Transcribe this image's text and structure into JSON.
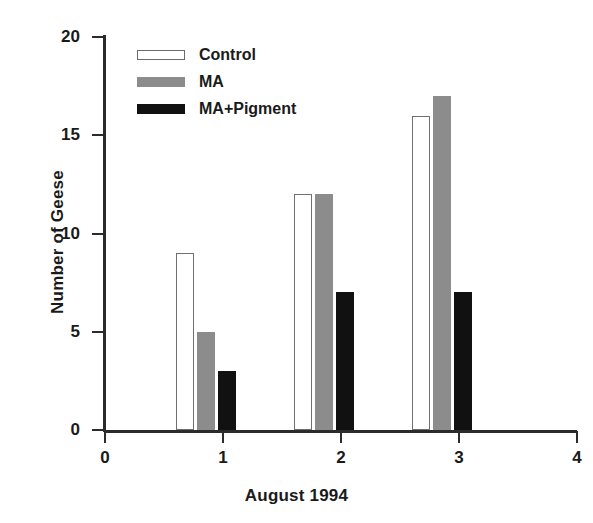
{
  "chart_data": {
    "type": "bar",
    "title": "",
    "xlabel": "August 1994",
    "ylabel": "Number of Geese",
    "categories": [
      "1",
      "2",
      "3"
    ],
    "series": [
      {
        "name": "Control",
        "values": [
          9,
          5,
          3
        ],
        "color": "#ffffff"
      },
      {
        "name": "MA",
        "values": [
          12,
          12,
          7
        ],
        "color": "#8c8c8c"
      },
      {
        "name": "MA+Pigment",
        "values": [
          16,
          17,
          7
        ],
        "color": "#111111"
      }
    ],
    "series_by_group": [
      {
        "group": "1",
        "Control": 9,
        "MA": 5,
        "MA+Pigment": 3
      },
      {
        "group": "2",
        "Control": 12,
        "MA": 12,
        "MA+Pigment": 7
      },
      {
        "group": "3",
        "Control": 16,
        "MA": 17,
        "MA+Pigment": 7
      }
    ],
    "xlim": [
      0,
      4
    ],
    "ylim": [
      0,
      20
    ],
    "xticks": [
      "0",
      "1",
      "2",
      "3",
      "4"
    ],
    "yticks": [
      "0",
      "5",
      "10",
      "15",
      "20"
    ],
    "grid": false,
    "legend_position": "top-left"
  },
  "legend": {
    "entries": [
      {
        "label": "Control"
      },
      {
        "label": "MA"
      },
      {
        "label": "MA+Pigment"
      }
    ]
  },
  "axes": {
    "y": {
      "label": "Number of Geese",
      "ticks": [
        {
          "value": 20,
          "label": "20"
        },
        {
          "value": 15,
          "label": "15"
        },
        {
          "value": 10,
          "label": "10"
        },
        {
          "value": 5,
          "label": "5"
        },
        {
          "value": 0,
          "label": "0"
        }
      ]
    },
    "x": {
      "label": "August 1994",
      "ticks": [
        {
          "value": 0,
          "label": "0"
        },
        {
          "value": 1,
          "label": "1"
        },
        {
          "value": 2,
          "label": "2"
        },
        {
          "value": 3,
          "label": "3"
        },
        {
          "value": 4,
          "label": "4"
        }
      ]
    }
  }
}
